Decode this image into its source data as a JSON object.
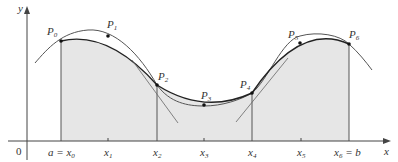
{
  "figure": {
    "colors": {
      "shade": "#e6e6e6",
      "curve": "#555555",
      "parabola": "#222222",
      "axis": "#444444",
      "text": "#333333"
    },
    "axes": {
      "x_label": "x",
      "y_label": "y",
      "origin_label": "0"
    },
    "x_ticks": [
      {
        "base": "a = x",
        "sub": "0",
        "suffix": ""
      },
      {
        "base": "x",
        "sub": "1",
        "suffix": ""
      },
      {
        "base": "x",
        "sub": "2",
        "suffix": ""
      },
      {
        "base": "x",
        "sub": "3",
        "suffix": ""
      },
      {
        "base": "x",
        "sub": "4",
        "suffix": ""
      },
      {
        "base": "x",
        "sub": "5",
        "suffix": ""
      },
      {
        "base": "x",
        "sub": "6",
        "suffix": " = b"
      }
    ],
    "points": [
      {
        "base": "P",
        "sub": "0"
      },
      {
        "base": "P",
        "sub": "1"
      },
      {
        "base": "P",
        "sub": "2"
      },
      {
        "base": "P",
        "sub": "3"
      },
      {
        "base": "P",
        "sub": "4"
      },
      {
        "base": "P",
        "sub": "5"
      },
      {
        "base": "P",
        "sub": "6"
      }
    ]
  }
}
